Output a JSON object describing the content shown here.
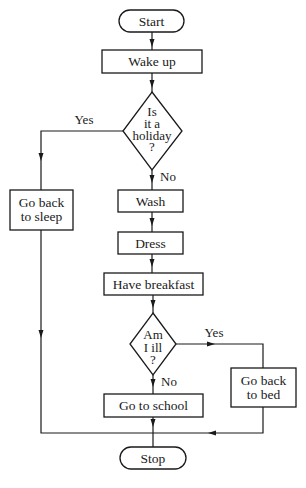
{
  "flowchart": {
    "nodes": {
      "start": {
        "label": "Start",
        "shape": "terminal"
      },
      "wake_up": {
        "label": "Wake up",
        "shape": "process"
      },
      "holiday": {
        "lines": [
          "Is",
          "it a",
          "holiday",
          "?"
        ],
        "shape": "decision"
      },
      "sleep": {
        "lines": [
          "Go back",
          "to sleep"
        ],
        "shape": "process"
      },
      "wash": {
        "label": "Wash",
        "shape": "process"
      },
      "dress": {
        "label": "Dress",
        "shape": "process"
      },
      "breakfast": {
        "label": "Have breakfast",
        "shape": "process"
      },
      "ill": {
        "lines": [
          "Am",
          "I ill",
          "?"
        ],
        "shape": "decision"
      },
      "bed": {
        "lines": [
          "Go back",
          "to bed"
        ],
        "shape": "process"
      },
      "school": {
        "label": "Go to school",
        "shape": "process"
      },
      "stop": {
        "label": "Stop",
        "shape": "terminal"
      }
    },
    "edge_labels": {
      "holiday_yes": "Yes",
      "holiday_no": "No",
      "ill_yes": "Yes",
      "ill_no": "No"
    },
    "edges": [
      [
        "start",
        "wake_up"
      ],
      [
        "wake_up",
        "holiday"
      ],
      [
        "holiday",
        "sleep",
        "Yes"
      ],
      [
        "holiday",
        "wash",
        "No"
      ],
      [
        "wash",
        "dress"
      ],
      [
        "dress",
        "breakfast"
      ],
      [
        "breakfast",
        "ill"
      ],
      [
        "ill",
        "bed",
        "Yes"
      ],
      [
        "ill",
        "school",
        "No"
      ],
      [
        "sleep",
        "stop"
      ],
      [
        "bed",
        "stop"
      ],
      [
        "school",
        "stop"
      ]
    ],
    "colors": {
      "stroke": "#1a1a1a",
      "background": "#ffffff"
    }
  }
}
